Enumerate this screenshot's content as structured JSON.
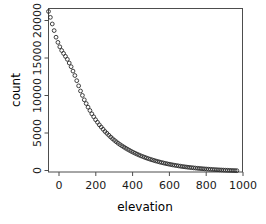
{
  "figure": {
    "background_color": "#ffffff",
    "frame_color": "#4d4d4d",
    "marker_color": "#2b2b2b"
  },
  "chart_data": {
    "type": "scatter",
    "title": "",
    "xlabel": "elevation",
    "ylabel": "count",
    "xlim": [
      0,
      1030
    ],
    "ylim": [
      0,
      22200
    ],
    "grid": false,
    "legend": null,
    "marker": "open-circle",
    "xticks": [
      0,
      200,
      400,
      600,
      800,
      1000
    ],
    "xtick_labels": [
      "0",
      "200",
      "400",
      "600",
      "800",
      "1000"
    ],
    "yticks": [
      0,
      5000,
      10000,
      15000,
      20000
    ],
    "ytick_labels": [
      "0",
      "5000",
      "10000",
      "15000",
      "20000"
    ],
    "x": [
      0,
      10,
      20,
      30,
      40,
      50,
      60,
      70,
      80,
      90,
      100,
      110,
      120,
      130,
      140,
      150,
      160,
      170,
      180,
      190,
      200,
      210,
      220,
      230,
      240,
      250,
      260,
      270,
      280,
      290,
      300,
      310,
      320,
      330,
      340,
      350,
      360,
      370,
      380,
      390,
      400,
      410,
      420,
      430,
      440,
      450,
      460,
      470,
      480,
      490,
      500,
      510,
      520,
      530,
      540,
      550,
      560,
      570,
      580,
      590,
      600,
      610,
      620,
      630,
      640,
      650,
      660,
      670,
      680,
      690,
      700,
      710,
      720,
      730,
      740,
      750,
      760,
      770,
      780,
      790,
      800,
      810,
      820,
      830,
      840,
      850,
      860,
      870,
      880,
      890,
      900,
      910,
      920,
      930,
      940,
      950,
      960,
      970,
      980,
      990,
      1000
    ],
    "y": [
      21800,
      21000,
      20100,
      19200,
      18300,
      17600,
      17000,
      16500,
      16100,
      15700,
      15300,
      14800,
      14300,
      13700,
      13100,
      12400,
      11700,
      11000,
      10400,
      9800,
      9300,
      8800,
      8350,
      7900,
      7500,
      7100,
      6750,
      6400,
      6100,
      5800,
      5500,
      5250,
      5000,
      4750,
      4520,
      4300,
      4100,
      3900,
      3720,
      3550,
      3390,
      3230,
      3080,
      2940,
      2800,
      2670,
      2545,
      2425,
      2310,
      2200,
      2100,
      2000,
      1905,
      1815,
      1730,
      1650,
      1570,
      1495,
      1425,
      1355,
      1290,
      1230,
      1170,
      1115,
      1060,
      1010,
      960,
      915,
      870,
      830,
      790,
      750,
      715,
      680,
      648,
      617,
      588,
      560,
      533,
      508,
      484,
      461,
      439,
      418,
      398,
      379,
      361,
      344,
      327,
      312,
      297,
      283,
      269,
      256,
      244,
      232,
      221,
      210,
      200,
      190,
      181
    ],
    "series": [
      {
        "name": "count vs elevation",
        "description": "exponential decay of count with increasing elevation"
      }
    ]
  }
}
